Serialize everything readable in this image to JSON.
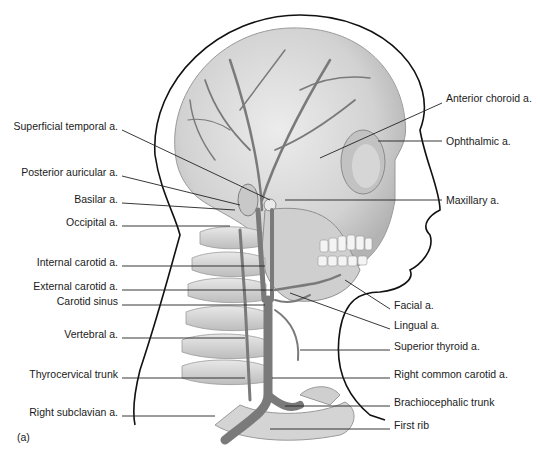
{
  "figure": {
    "panel_label": "(a)",
    "left_labels": [
      {
        "text": "Superficial temporal a.",
        "x": 118,
        "y": 126
      },
      {
        "text": "Posterior auricular a.",
        "x": 118,
        "y": 172
      },
      {
        "text": "Basilar a.",
        "x": 118,
        "y": 199
      },
      {
        "text": "Occipital a.",
        "x": 118,
        "y": 222
      },
      {
        "text": "Internal carotid a.",
        "x": 118,
        "y": 262
      },
      {
        "text": "External carotid a.",
        "x": 118,
        "y": 286
      },
      {
        "text": "Carotid sinus",
        "x": 118,
        "y": 301
      },
      {
        "text": "Vertebral a.",
        "x": 118,
        "y": 334
      },
      {
        "text": "Thyrocervical trunk",
        "x": 118,
        "y": 374
      },
      {
        "text": "Right subclavian a.",
        "x": 118,
        "y": 412
      }
    ],
    "right_labels": [
      {
        "text": "Anterior choroid a.",
        "x": 446,
        "y": 98
      },
      {
        "text": "Ophthalmic a.",
        "x": 446,
        "y": 141
      },
      {
        "text": "Maxillary a.",
        "x": 446,
        "y": 200
      },
      {
        "text": "Facial a.",
        "x": 394,
        "y": 305
      },
      {
        "text": "Lingual a.",
        "x": 394,
        "y": 325
      },
      {
        "text": "Superior thyroid a.",
        "x": 394,
        "y": 346
      },
      {
        "text": "Right common carotid a.",
        "x": 394,
        "y": 374
      },
      {
        "text": "Brachiocephalic trunk",
        "x": 394,
        "y": 402
      },
      {
        "text": "First rib",
        "x": 394,
        "y": 425
      }
    ]
  },
  "colors": {
    "bone": "#d9d9d9",
    "bone_shadow": "#a8a8a8",
    "artery": "#7a7a7a",
    "outline": "#111111",
    "leader": "#222222"
  }
}
